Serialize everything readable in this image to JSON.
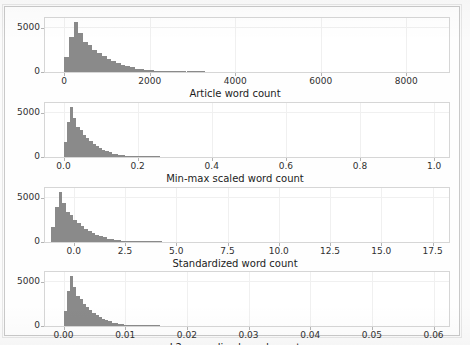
{
  "figure": {
    "width": 470,
    "height": 345,
    "background_color": "#fbfbfb",
    "bar_color": "#8a8a8a",
    "axis_color": "#d6d6d6",
    "grid_color": "#f0f0f0",
    "text_color": "#303030"
  },
  "chart_data": [
    {
      "type": "bar",
      "subplot_index": 0,
      "title": "",
      "xlabel": "Article word count",
      "ylabel": "",
      "grid": true,
      "legend": "none",
      "xlim": [
        -450,
        9000
      ],
      "ylim": [
        0,
        6200
      ],
      "xticks": [
        0,
        2000,
        4000,
        6000,
        8000
      ],
      "xtick_labels": [
        "0",
        "2000",
        "4000",
        "6000",
        "8000"
      ],
      "yticks": [
        0,
        5000
      ],
      "ytick_labels": [
        "0",
        "5000"
      ],
      "bin_edges": [
        0,
        110,
        220,
        330,
        440,
        550,
        660,
        770,
        880,
        990,
        1100,
        1210,
        1320,
        1430,
        1540,
        1650,
        1760,
        1870,
        1980,
        2090,
        2200,
        2310,
        2420,
        2530,
        2640,
        2750,
        2860,
        2970,
        3080,
        3190,
        3300
      ],
      "counts": [
        1700,
        4000,
        5750,
        4450,
        3450,
        3100,
        2500,
        2150,
        1800,
        1500,
        1250,
        1000,
        820,
        650,
        520,
        400,
        330,
        260,
        200,
        165,
        135,
        110,
        90,
        75,
        60,
        50,
        40,
        32,
        26,
        20
      ]
    },
    {
      "type": "bar",
      "subplot_index": 1,
      "title": "",
      "xlabel": "Min-max scaled word count",
      "ylabel": "",
      "grid": true,
      "legend": "none",
      "xlim": [
        -0.05,
        1.04
      ],
      "ylim": [
        0,
        6200
      ],
      "xticks": [
        0.0,
        0.2,
        0.4,
        0.6,
        0.8,
        1.0
      ],
      "xtick_labels": [
        "0.0",
        "0.2",
        "0.4",
        "0.6",
        "0.8",
        "1.0"
      ],
      "yticks": [
        0,
        5000
      ],
      "ytick_labels": [
        "0",
        "5000"
      ],
      "bin_edges": [
        0.0,
        0.0087,
        0.0174,
        0.0261,
        0.0348,
        0.0435,
        0.0522,
        0.0609,
        0.0696,
        0.0783,
        0.087,
        0.0957,
        0.1044,
        0.1131,
        0.1218,
        0.1305,
        0.1392,
        0.1479,
        0.1566,
        0.1653,
        0.174,
        0.1827,
        0.1914,
        0.2001,
        0.2088,
        0.2175,
        0.2262,
        0.2349,
        0.2436,
        0.2523,
        0.261
      ],
      "counts": [
        1700,
        4000,
        5750,
        4450,
        3450,
        3100,
        2500,
        2150,
        1800,
        1500,
        1250,
        1000,
        820,
        650,
        520,
        400,
        330,
        260,
        200,
        165,
        135,
        110,
        90,
        75,
        60,
        50,
        40,
        32,
        26,
        20
      ]
    },
    {
      "type": "bar",
      "subplot_index": 2,
      "title": "",
      "xlabel": "Standardized word count",
      "ylabel": "",
      "grid": true,
      "legend": "none",
      "xlim": [
        -1.4,
        18.3
      ],
      "ylim": [
        0,
        6200
      ],
      "xticks": [
        0.0,
        2.5,
        5.0,
        7.5,
        10.0,
        12.5,
        15.0,
        17.5
      ],
      "xtick_labels": [
        "0.0",
        "2.5",
        "5.0",
        "7.5",
        "10.0",
        "12.5",
        "15.0",
        "17.5"
      ],
      "yticks": [
        0,
        5000
      ],
      "ytick_labels": [
        "0",
        "5000"
      ],
      "bin_edges": [
        -1.1,
        -0.92,
        -0.74,
        -0.56,
        -0.38,
        -0.2,
        -0.02,
        0.16,
        0.34,
        0.52,
        0.7,
        0.88,
        1.06,
        1.24,
        1.42,
        1.6,
        1.78,
        1.96,
        2.14,
        2.32,
        2.5,
        2.68,
        2.86,
        3.04,
        3.22,
        3.4,
        3.58,
        3.76,
        3.94,
        4.12,
        4.3
      ],
      "counts": [
        1700,
        4000,
        5750,
        4450,
        3450,
        3100,
        2500,
        2150,
        1800,
        1500,
        1250,
        1000,
        820,
        650,
        520,
        400,
        330,
        260,
        200,
        165,
        135,
        110,
        90,
        75,
        60,
        50,
        40,
        32,
        26,
        20
      ]
    },
    {
      "type": "bar",
      "subplot_index": 3,
      "title": "",
      "xlabel": "L2-normalized word count",
      "ylabel": "",
      "grid": true,
      "legend": "none",
      "xlim": [
        -0.003,
        0.0625
      ],
      "ylim": [
        0,
        6200
      ],
      "xticks": [
        0.0,
        0.01,
        0.02,
        0.03,
        0.04,
        0.05,
        0.06
      ],
      "xtick_labels": [
        "0.00",
        "0.01",
        "0.02",
        "0.03",
        "0.04",
        "0.05",
        "0.06"
      ],
      "yticks": [
        0,
        5000
      ],
      "ytick_labels": [
        "0",
        "5000"
      ],
      "bin_edges": [
        0.0,
        0.00052,
        0.00104,
        0.00156,
        0.00208,
        0.0026,
        0.00312,
        0.00364,
        0.00416,
        0.00468,
        0.0052,
        0.00572,
        0.00624,
        0.00676,
        0.00728,
        0.0078,
        0.00832,
        0.00884,
        0.00936,
        0.00988,
        0.0104,
        0.01092,
        0.01144,
        0.01196,
        0.01248,
        0.013,
        0.01352,
        0.01404,
        0.01456,
        0.01508,
        0.0156
      ],
      "counts": [
        1700,
        4000,
        5750,
        4450,
        3450,
        3100,
        2500,
        2150,
        1800,
        1500,
        1250,
        1000,
        820,
        650,
        520,
        400,
        330,
        260,
        200,
        165,
        135,
        110,
        90,
        75,
        60,
        50,
        40,
        32,
        26,
        20
      ]
    }
  ]
}
